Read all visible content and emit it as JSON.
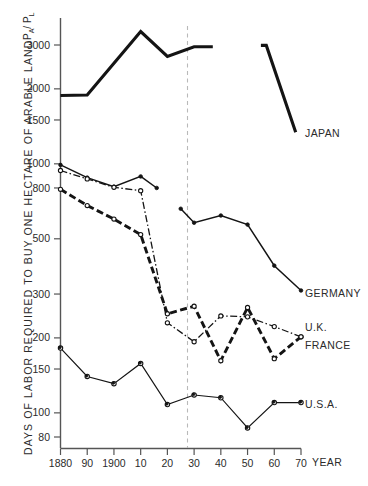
{
  "chart_data": {
    "type": "line",
    "title": "",
    "xlabel": "YEAR",
    "ylabel": "DAYS OF LABOR REQUIRED TO BUY ONE HECTARE OF ARABLE LAND",
    "ylabel_ratio": "P",
    "ylabel_ratio_sub_a": "A",
    "ylabel_ratio_slash": "/ P",
    "ylabel_ratio_sub_l": "L",
    "yscale": "log",
    "ylim": [
      76,
      3800
    ],
    "ytick_labels": [
      "3000",
      "2000",
      "1500",
      "1000",
      "800",
      "500",
      "300",
      "200",
      "150",
      "100",
      "80"
    ],
    "ytick_values": [
      3000,
      2000,
      1500,
      1000,
      800,
      500,
      300,
      200,
      150,
      100,
      80
    ],
    "xlim": [
      1880,
      1970
    ],
    "xtick_labels": [
      "1880",
      "90",
      "1900",
      "10",
      "20",
      "30",
      "40",
      "50",
      "60",
      "70"
    ],
    "xtick_values": [
      1880,
      1890,
      1900,
      1910,
      1920,
      1930,
      1940,
      1950,
      1960,
      1970
    ],
    "grid": false,
    "legend_position": "right-inline",
    "annotations": [
      {
        "name": "war-divider",
        "x": 1930,
        "style": "vertical dashed line"
      }
    ],
    "series": [
      {
        "name": "JAPAN",
        "label": "JAPAN",
        "style": "solid-thick",
        "markers": "none",
        "x": [
          1880,
          1890,
          1910,
          1920,
          1930,
          1937,
          null,
          1955,
          1957,
          1968
        ],
        "y": [
          1880,
          1890,
          3400,
          2700,
          2950,
          2950,
          null,
          2990,
          2990,
          1340
        ]
      },
      {
        "name": "GERMANY",
        "label": "GERMANY",
        "style": "solid-thin-dots",
        "markers": "filled",
        "x": [
          1880,
          1890,
          1900,
          1910,
          1916,
          null,
          1925,
          1930,
          1940,
          1950,
          1960,
          1970
        ],
        "y": [
          990,
          880,
          810,
          890,
          800,
          null,
          660,
          580,
          620,
          570,
          390,
          310
        ]
      },
      {
        "name": "U.K.",
        "label": "U.K.",
        "style": "dash-dot-thin",
        "markers": "open",
        "x": [
          1880,
          1890,
          1900,
          1910,
          1920,
          1930,
          1940,
          1950,
          1960,
          1970
        ],
        "y": [
          940,
          870,
          805,
          780,
          230,
          193,
          245,
          243,
          222,
          202
        ]
      },
      {
        "name": "FRANCE",
        "label": "FRANCE",
        "style": "dashed-thick",
        "markers": "open",
        "x": [
          1880,
          1890,
          1900,
          1910,
          1920,
          1930,
          1940,
          1950,
          1960,
          1970
        ],
        "y": [
          790,
          680,
          600,
          520,
          250,
          268,
          162,
          265,
          165,
          202
        ]
      },
      {
        "name": "U.S.A.",
        "label": "U.S.A.",
        "style": "solid-thin-dots",
        "markers": "both",
        "x": [
          1880,
          1890,
          1900,
          1910,
          1920,
          1930,
          1940,
          1950,
          1960,
          1970
        ],
        "y": [
          182,
          140,
          131,
          158,
          108,
          118,
          115,
          87,
          110,
          110
        ]
      }
    ]
  }
}
